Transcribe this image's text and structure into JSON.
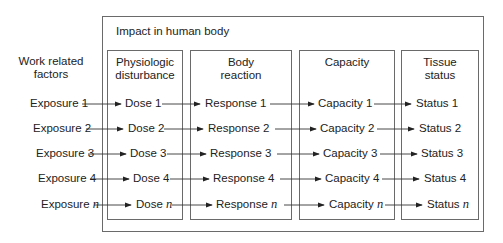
{
  "diagram": {
    "outer_title": "Impact in human body",
    "left_header": [
      "Work related",
      "factors"
    ],
    "columns": [
      {
        "header": [
          "Physiologic",
          "disturbance"
        ],
        "items": [
          "Dose 1",
          "Dose 2",
          "Dose 3",
          "Dose 4",
          "Dose"
        ]
      },
      {
        "header": [
          "Body",
          "reaction"
        ],
        "items": [
          "Response 1",
          "Response 2",
          "Response 3",
          "Response 4",
          "Response"
        ]
      },
      {
        "header": [
          "Capacity"
        ],
        "items": [
          "Capacity 1",
          "Capacity 2",
          "Capacity 3",
          "Capacity 4",
          "Capacity"
        ]
      },
      {
        "header": [
          "Tissue",
          "status"
        ],
        "items": [
          "Status 1",
          "Status 2",
          "Status 3",
          "Status 4",
          "Status"
        ]
      }
    ],
    "exposures": [
      "Exposure 1",
      "Exposure 2",
      "Exposure 3",
      "Exposure 4",
      "Exposure"
    ],
    "italic_suffix": "n",
    "colors": {
      "line": "#6a6a6a",
      "arrow": "#222222",
      "text": "#222222"
    }
  }
}
